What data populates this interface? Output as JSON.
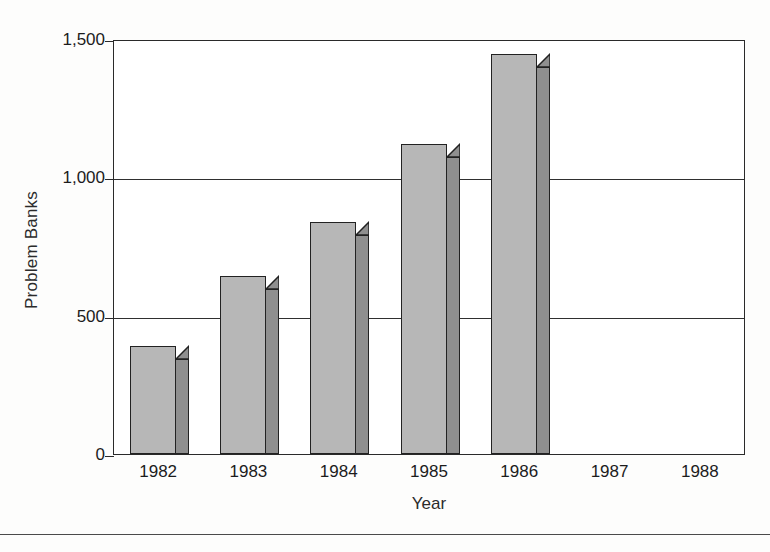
{
  "chart_data": {
    "type": "bar",
    "title": "",
    "xlabel": "Year",
    "ylabel": "Problem Banks",
    "categories": [
      "1982",
      "1983",
      "1984",
      "1985",
      "1986",
      "1987",
      "1988"
    ],
    "values": [
      390,
      642,
      838,
      1120,
      1447,
      null,
      null
    ],
    "ylim": [
      0,
      1500
    ],
    "yticks": [
      0,
      500,
      1000,
      1500
    ],
    "ytick_labels": [
      "0",
      "500",
      "1,000",
      "1,500"
    ],
    "grid": "horizontal",
    "legend": "none",
    "style": "3d-bar",
    "colors": {
      "bar_front": "#b7b7b7",
      "bar_side": "#8f8f8f",
      "bar_top": "#a8a8a8",
      "outline": "#222222",
      "axis": "#2a2a2a",
      "background": "#ffffff"
    }
  }
}
